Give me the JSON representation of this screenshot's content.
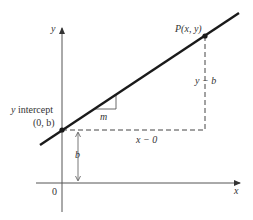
{
  "diagram": {
    "type": "slope-intercept line diagram",
    "axes": {
      "x_label": "x",
      "y_label": "y",
      "origin_label": "0"
    },
    "labels": {
      "point_p": "P(x, y)",
      "y_intercept_title": "y intercept",
      "y_intercept_point": "(0, b)",
      "slope": "m",
      "rise": "y − b",
      "run": "x − 0",
      "b_distance": "b"
    },
    "colors": {
      "line": "#1a1a1a",
      "axis": "#444444",
      "dashed": "#444444",
      "text": "#333333",
      "background": "#ffffff"
    }
  }
}
